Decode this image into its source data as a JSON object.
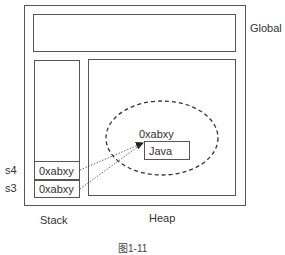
{
  "diagram": {
    "regions": {
      "global": "Global",
      "stack": "Stack",
      "heap": "Heap"
    },
    "stack_cells": [
      {
        "var": "s4",
        "value": "0xabxy"
      },
      {
        "var": "s3",
        "value": "0xabxy"
      }
    ],
    "heap_object": {
      "address": "0xabxy",
      "value": "Java"
    },
    "caption": "图1-11"
  }
}
